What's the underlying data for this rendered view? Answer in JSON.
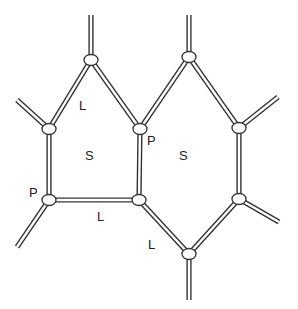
{
  "diagram": {
    "stroke_color": "#333333",
    "fill_color": "#ffffff",
    "nodes": [
      {
        "id": "A"
      },
      {
        "id": "B"
      },
      {
        "id": "C"
      },
      {
        "id": "D"
      },
      {
        "id": "E"
      },
      {
        "id": "F"
      },
      {
        "id": "G"
      },
      {
        "id": "H"
      },
      {
        "id": "I"
      }
    ],
    "edges": [
      [
        "A",
        "B"
      ],
      [
        "A",
        "C"
      ],
      [
        "B",
        "D"
      ],
      [
        "C",
        "E"
      ],
      [
        "D",
        "E"
      ],
      [
        "C",
        "F"
      ],
      [
        "F",
        "G"
      ],
      [
        "G",
        "H"
      ],
      [
        "H",
        "I"
      ],
      [
        "E",
        "I"
      ]
    ],
    "labels": {
      "l1": "L",
      "s1": "S",
      "p1": "P",
      "s2": "S",
      "p2": "P",
      "l2": "L",
      "l3": "L"
    }
  }
}
